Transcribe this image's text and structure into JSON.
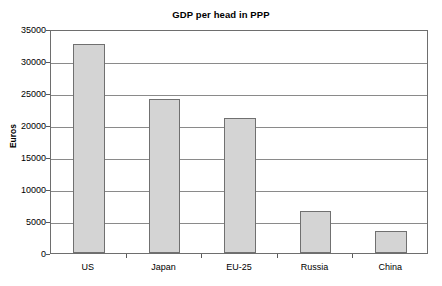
{
  "chart_data": {
    "type": "bar",
    "title": "GDP per head in PPP",
    "xlabel": "",
    "ylabel": "Euros",
    "categories": [
      "US",
      "Japan",
      "EU-25",
      "Russia",
      "China"
    ],
    "values": [
      32700,
      24000,
      21100,
      6500,
      3500
    ],
    "ylim": [
      0,
      35000
    ],
    "ytick_values": [
      0,
      5000,
      10000,
      15000,
      20000,
      25000,
      30000,
      35000
    ],
    "ytick_labels": [
      "0",
      "5000",
      "10000",
      "15000",
      "20000",
      "25000",
      "30000",
      "35000"
    ],
    "grid": "horizontal",
    "legend": null,
    "series": [
      {
        "name": "GDP per head in PPP",
        "values": [
          32700,
          24000,
          21100,
          6500,
          3500
        ]
      }
    ],
    "colors": {
      "bar_fill": "#d4d4d4",
      "bar_border": "#707070",
      "gridline": "#8a8a8a",
      "axis": "#6e6e6e",
      "text": "#000000",
      "background": "#ffffff"
    }
  }
}
